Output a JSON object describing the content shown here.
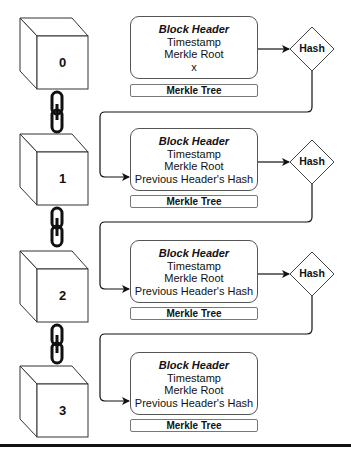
{
  "diagram": {
    "type": "blockchain-structure",
    "blocks": [
      {
        "number": "0",
        "header": {
          "title": "Block Header",
          "fields": [
            "Timestamp",
            "Merkle Root",
            "x"
          ]
        },
        "merkle_label": "Merkle Tree",
        "hash_label": "Hash"
      },
      {
        "number": "1",
        "header": {
          "title": "Block Header",
          "fields": [
            "Timestamp",
            "Merkle Root",
            "Previous Header's Hash"
          ]
        },
        "merkle_label": "Merkle Tree",
        "hash_label": "Hash"
      },
      {
        "number": "2",
        "header": {
          "title": "Block Header",
          "fields": [
            "Timestamp",
            "Merkle Root",
            "Previous Header's Hash"
          ]
        },
        "merkle_label": "Merkle Tree",
        "hash_label": "Hash"
      },
      {
        "number": "3",
        "header": {
          "title": "Block Header",
          "fields": [
            "Timestamp",
            "Merkle Root",
            "Previous Header's Hash"
          ]
        },
        "merkle_label": "Merkle Tree"
      }
    ],
    "edges": [
      {
        "from": "block-0-header",
        "to": "hash-0"
      },
      {
        "from": "hash-0",
        "to": "block-1-header"
      },
      {
        "from": "block-1-header",
        "to": "hash-1"
      },
      {
        "from": "hash-1",
        "to": "block-2-header"
      },
      {
        "from": "block-2-header",
        "to": "hash-2"
      },
      {
        "from": "hash-2",
        "to": "block-3-header"
      }
    ],
    "chain_links": [
      {
        "between": [
          "0",
          "1"
        ]
      },
      {
        "between": [
          "1",
          "2"
        ]
      },
      {
        "between": [
          "2",
          "3"
        ]
      }
    ],
    "colors": {
      "stroke": "#111111",
      "box_border": "#555555",
      "background": "#ffffff"
    }
  }
}
